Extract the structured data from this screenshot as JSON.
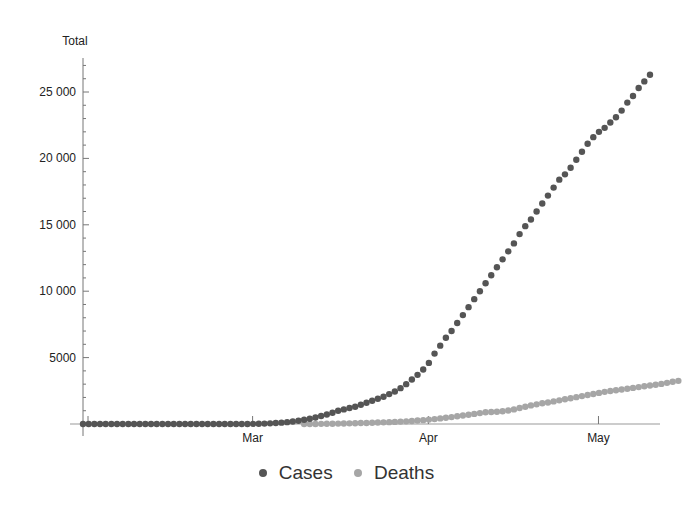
{
  "chart_data": {
    "type": "scatter",
    "title": "",
    "xlabel": "",
    "ylabel": "Total",
    "ylim": [
      0,
      27500
    ],
    "grid": false,
    "legend_position": "bottom",
    "x_start_date": "Jan 31",
    "x_ticks": [
      {
        "label": "Mar",
        "day": 29
      },
      {
        "label": "Apr",
        "day": 60
      },
      {
        "label": "May",
        "day": 90
      }
    ],
    "y_ticks": [
      5000,
      10000,
      15000,
      20000,
      25000
    ],
    "y_tick_labels": [
      "5000",
      "10 000",
      "15 000",
      "20 000",
      "25 000"
    ],
    "series": [
      {
        "name": "Cases",
        "color": "#555555",
        "start_day": 0,
        "values": [
          0,
          0,
          0,
          0,
          0,
          0,
          0,
          0,
          0,
          0,
          0,
          0,
          0,
          0,
          0,
          0,
          0,
          0,
          0,
          0,
          0,
          0,
          0,
          0,
          0,
          0,
          0,
          0,
          0,
          0,
          10,
          20,
          30,
          50,
          70,
          100,
          140,
          190,
          250,
          320,
          400,
          490,
          600,
          720,
          850,
          1000,
          1100,
          1200,
          1300,
          1450,
          1600,
          1750,
          1900,
          2050,
          2250,
          2450,
          2700,
          3000,
          3350,
          3700,
          4100,
          4600,
          5300,
          5900,
          6500,
          7000,
          7600,
          8200,
          8800,
          9400,
          10000,
          10600,
          11200,
          11800,
          12400,
          13000,
          13600,
          14300,
          14900,
          15400,
          16000,
          16600,
          17200,
          17800,
          18400,
          18800,
          19300,
          19900,
          20500,
          21100,
          21600,
          22000,
          22300,
          22700,
          23100,
          23600,
          24200,
          24700,
          25300,
          25800,
          26300
        ],
        "values_note": "estimated from pixel positions; one point per day"
      },
      {
        "name": "Deaths",
        "color": "#a6a6a6",
        "start_day": 39,
        "values": [
          0,
          0,
          5,
          10,
          15,
          20,
          30,
          40,
          50,
          60,
          70,
          80,
          95,
          110,
          125,
          140,
          160,
          180,
          200,
          230,
          260,
          290,
          330,
          370,
          420,
          470,
          520,
          580,
          640,
          700,
          760,
          820,
          880,
          900,
          920,
          960,
          1020,
          1100,
          1200,
          1300,
          1400,
          1480,
          1560,
          1620,
          1700,
          1780,
          1860,
          1940,
          2020,
          2100,
          2180,
          2260,
          2340,
          2420,
          2480,
          2540,
          2600,
          2660,
          2720,
          2780,
          2840,
          2900,
          2960,
          3020,
          3100,
          3180,
          3250
        ]
      }
    ]
  },
  "axes": {
    "y_title": "Total",
    "y_labels": [
      "25 000",
      "20 000",
      "15 000",
      "10 000",
      "5000"
    ],
    "x_labels": [
      "Mar",
      "Apr",
      "May"
    ]
  },
  "legend": {
    "items": [
      {
        "label": "Cases",
        "color": "#555555"
      },
      {
        "label": "Deaths",
        "color": "#a6a6a6"
      }
    ]
  }
}
